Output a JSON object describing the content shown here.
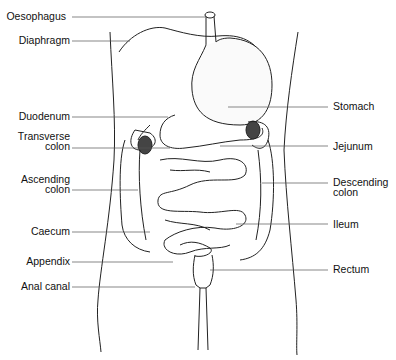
{
  "diagram": {
    "left_labels": [
      {
        "id": "oesophagus",
        "text": "Oesophagus",
        "y": 15
      },
      {
        "id": "diaphragm",
        "text": "Diaphragm",
        "y": 40
      },
      {
        "id": "duodenum",
        "text": "Duodenum",
        "y": 115
      },
      {
        "id": "transverse-colon",
        "line1": "Transverse",
        "line2": "colon",
        "y": 147
      },
      {
        "id": "ascending-colon",
        "line1": "Ascending",
        "line2": "colon",
        "y": 190
      },
      {
        "id": "caecum",
        "text": "Caecum",
        "y": 231
      },
      {
        "id": "appendix",
        "text": "Appendix",
        "y": 262
      },
      {
        "id": "anal-canal",
        "text": "Anal canal",
        "y": 287
      }
    ],
    "right_labels": [
      {
        "id": "stomach",
        "text": "Stomach",
        "y": 106
      },
      {
        "id": "jejunum",
        "text": "Jejunum",
        "y": 146
      },
      {
        "id": "descending-colon",
        "line1": "Descending",
        "line2": "colon",
        "y": 186
      },
      {
        "id": "ileum",
        "text": "Ileum",
        "y": 224
      },
      {
        "id": "rectum",
        "text": "Rectum",
        "y": 268
      }
    ]
  }
}
